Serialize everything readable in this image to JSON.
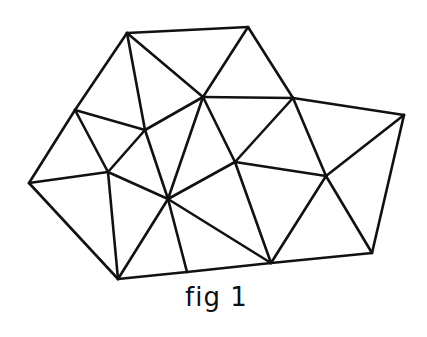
{
  "figure": {
    "caption": "fig 1",
    "type": "triangulated mesh",
    "stroke_color": "#111111",
    "background": "#ffffff",
    "vertices": {
      "A": [
        127,
        33
      ],
      "E": [
        248,
        27
      ],
      "B": [
        75,
        110
      ],
      "C": [
        145,
        130
      ],
      "D": [
        203,
        97
      ],
      "F": [
        293,
        98
      ],
      "G": [
        404,
        115
      ],
      "H": [
        235,
        162
      ],
      "I": [
        29,
        183
      ],
      "J": [
        108,
        172
      ],
      "K": [
        168,
        199
      ],
      "N": [
        326,
        176
      ],
      "L": [
        118,
        279
      ],
      "M": [
        187,
        272
      ],
      "O": [
        271,
        263
      ],
      "P": [
        372,
        253
      ]
    },
    "edges": [
      [
        "A",
        "E"
      ],
      [
        "E",
        "F"
      ],
      [
        "F",
        "G"
      ],
      [
        "G",
        "P"
      ],
      [
        "P",
        "O"
      ],
      [
        "O",
        "M"
      ],
      [
        "M",
        "L"
      ],
      [
        "L",
        "I"
      ],
      [
        "I",
        "B"
      ],
      [
        "B",
        "A"
      ],
      [
        "A",
        "C"
      ],
      [
        "A",
        "D"
      ],
      [
        "E",
        "D"
      ],
      [
        "D",
        "F"
      ],
      [
        "B",
        "C"
      ],
      [
        "B",
        "J"
      ],
      [
        "C",
        "J"
      ],
      [
        "C",
        "D"
      ],
      [
        "C",
        "K"
      ],
      [
        "D",
        "K"
      ],
      [
        "D",
        "H"
      ],
      [
        "F",
        "H"
      ],
      [
        "F",
        "N"
      ],
      [
        "H",
        "N"
      ],
      [
        "H",
        "K"
      ],
      [
        "H",
        "O"
      ],
      [
        "G",
        "N"
      ],
      [
        "N",
        "O"
      ],
      [
        "N",
        "P"
      ],
      [
        "I",
        "J"
      ],
      [
        "J",
        "K"
      ],
      [
        "J",
        "L"
      ],
      [
        "K",
        "L"
      ],
      [
        "K",
        "M"
      ],
      [
        "K",
        "O"
      ]
    ]
  }
}
